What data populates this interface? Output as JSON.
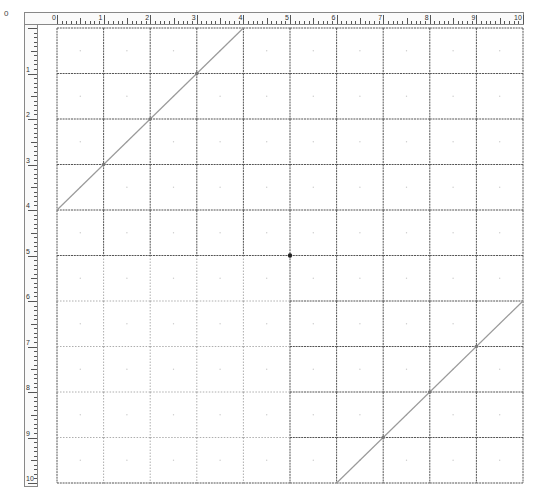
{
  "corner_label": "0",
  "rulers": {
    "top": {
      "labels": [
        "0",
        "1",
        "2",
        "3",
        "4",
        "5",
        "6",
        "7",
        "8",
        "9",
        "10"
      ]
    },
    "left": {
      "labels": [
        "1",
        "2",
        "3",
        "4",
        "5",
        "6",
        "7",
        "8",
        "9",
        "10"
      ]
    }
  },
  "grid": {
    "origin_x": 57,
    "origin_y": 28,
    "cell_w": 46.6,
    "cell_h": 45.5,
    "cols": 10,
    "rows": 10,
    "line_color": "#555555",
    "light_line_color": "#999999",
    "light_quadrant": "bottom-left",
    "center_dot_color": "#222222"
  },
  "diagonals": [
    {
      "name": "top-left-diagonal",
      "from": [
        0,
        4
      ],
      "to": [
        4,
        0
      ],
      "marked_points": [
        [
          1,
          3
        ],
        [
          2,
          2
        ],
        [
          3,
          1
        ]
      ]
    },
    {
      "name": "bottom-right-diagonal",
      "from": [
        6,
        10
      ],
      "to": [
        10,
        6
      ],
      "marked_points": [
        [
          7,
          9
        ],
        [
          8,
          8
        ],
        [
          9,
          7
        ]
      ]
    }
  ],
  "colors": {
    "diagonal": "#9a9a9a",
    "ruler_border": "#888888"
  }
}
